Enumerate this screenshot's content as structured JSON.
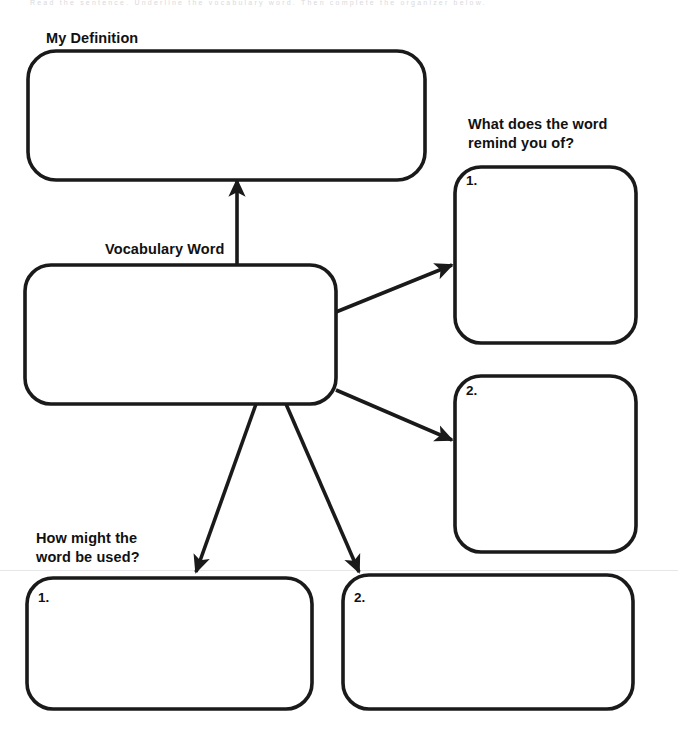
{
  "worksheet": {
    "title": "Vocabulary Word Graphic Organizer",
    "scan_header_text": "Read the sentence. Underline the vocabulary word. Then complete the organizer below.",
    "background_color": "#ffffff",
    "ink_color": "#1a1a1a",
    "rule_color": "#e6e6ea"
  },
  "labels": {
    "my_definition": "My Definition",
    "remind_you_of": "What does the word\nremind you of?",
    "vocabulary_word": "Vocabulary Word",
    "how_might_be_used": "How might the\nword be used?"
  },
  "boxes": {
    "my_definition": {
      "name": "my-definition-box",
      "value": ""
    },
    "vocabulary_word": {
      "name": "vocabulary-word-box",
      "value": ""
    },
    "remind_1": {
      "number": "1.",
      "value": ""
    },
    "remind_2": {
      "number": "2.",
      "value": ""
    },
    "usage_1": {
      "number": "1.",
      "value": ""
    },
    "usage_2": {
      "number": "2.",
      "value": ""
    }
  },
  "connectors": [
    {
      "name": "arrow-vocab-to-definition",
      "from": "vocabulary_word",
      "to": "my_definition",
      "direction": "up"
    },
    {
      "name": "arrow-vocab-to-remind-1",
      "from": "vocabulary_word",
      "to": "remind_1",
      "direction": "up-right"
    },
    {
      "name": "arrow-vocab-to-remind-2",
      "from": "vocabulary_word",
      "to": "remind_2",
      "direction": "down-right"
    },
    {
      "name": "arrow-vocab-to-usage-1",
      "from": "vocabulary_word",
      "to": "usage_1",
      "direction": "down-left"
    },
    {
      "name": "arrow-vocab-to-usage-2",
      "from": "vocabulary_word",
      "to": "usage_2",
      "direction": "down-right"
    }
  ]
}
